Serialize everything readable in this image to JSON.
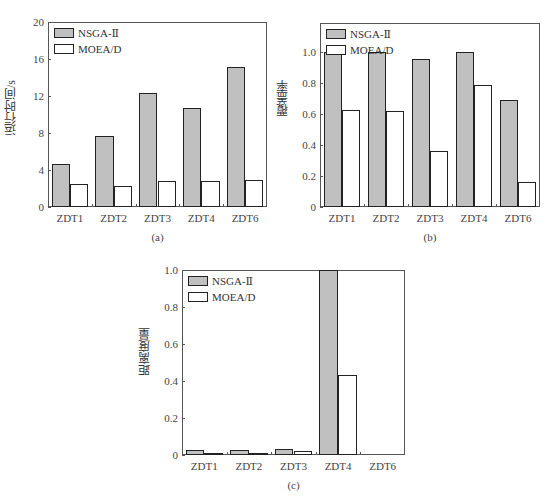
{
  "legend": {
    "series_a": "NSGA-Ⅱ",
    "series_b": "MOEA/D"
  },
  "colors": {
    "nsga": "#c0c0c0",
    "moead": "#ffffff",
    "border": "#222222"
  },
  "chart_data": [
    {
      "type": "bar",
      "caption": "(a)",
      "title": "",
      "xlabel": "",
      "ylabel": "运行时间/s",
      "categories": [
        "ZDT1",
        "ZDT2",
        "ZDT3",
        "ZDT4",
        "ZDT6"
      ],
      "series": [
        {
          "name": "NSGA-Ⅱ",
          "values": [
            4.7,
            7.7,
            12.3,
            10.7,
            15.1
          ]
        },
        {
          "name": "MOEA/D",
          "values": [
            2.5,
            2.3,
            2.8,
            2.8,
            2.9
          ]
        }
      ],
      "yticks": [
        "0",
        "4",
        "8",
        "12",
        "16",
        "20"
      ],
      "ylim": [
        0,
        20
      ],
      "grid": false,
      "legend_position": "upper left"
    },
    {
      "type": "bar",
      "caption": "(b)",
      "title": "",
      "xlabel": "",
      "ylabel": "覆盖率",
      "categories": [
        "ZDT1",
        "ZDT2",
        "ZDT3",
        "ZDT4",
        "ZDT6"
      ],
      "series": [
        {
          "name": "NSGA-Ⅱ",
          "values": [
            1.0,
            1.0,
            0.96,
            1.0,
            0.69
          ]
        },
        {
          "name": "MOEA/D",
          "values": [
            0.63,
            0.62,
            0.36,
            0.79,
            0.16
          ]
        }
      ],
      "yticks": [
        "0",
        "0.2",
        "0.4",
        "0.6",
        "0.8",
        "1.0"
      ],
      "ylim": [
        0,
        1.19
      ],
      "grid": false,
      "legend_position": "upper left"
    },
    {
      "type": "bar",
      "caption": "(c)",
      "title": "",
      "xlabel": "",
      "ylabel": "距离度量",
      "categories": [
        "ZDT1",
        "ZDT2",
        "ZDT3",
        "ZDT4",
        "ZDT6"
      ],
      "series": [
        {
          "name": "NSGA-Ⅱ",
          "values": [
            0.025,
            0.025,
            0.03,
            1.0,
            0.0
          ]
        },
        {
          "name": "MOEA/D",
          "values": [
            0.01,
            0.01,
            0.02,
            0.43,
            0.0
          ]
        }
      ],
      "yticks": [
        "0",
        "0.2",
        "0.4",
        "0.6",
        "0.8",
        "1.0"
      ],
      "ylim": [
        0,
        1.0
      ],
      "grid": false,
      "legend_position": "upper left"
    }
  ]
}
